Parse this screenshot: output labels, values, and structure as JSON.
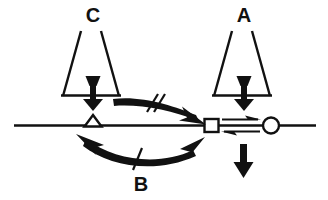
{
  "figure": {
    "type": "schematic-diagram",
    "background_color": "#ffffff",
    "ink_color": "#111111",
    "width": 328,
    "height": 200,
    "labels": {
      "c_label": "C",
      "a_label": "A",
      "b_label": "B"
    },
    "elements": {
      "baseline_name": "horizontal-baseline",
      "triangle_node_name": "triangle-marker",
      "square_node_name": "square-marker",
      "circle_node_name": "circle-marker",
      "left_trapezoid_name": "trapezoid-c",
      "right_trapezoid_name": "trapezoid-a",
      "left_load_arrow_name": "load-arrow-c",
      "right_load_arrow_name": "load-arrow-a",
      "down_arrow_name": "down-arrow-reaction",
      "top_curved_arrow_name": "curved-arrow-top",
      "bottom_curved_arrow_name": "curved-arrow-bottom",
      "equilibrium_arrows_name": "equilibrium-arrow-pair",
      "double_slash_name": "double-slash-mark",
      "single_slash_name": "single-slash-mark"
    }
  }
}
